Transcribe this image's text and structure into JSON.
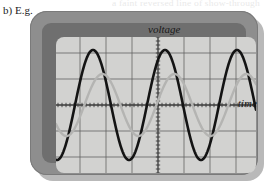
{
  "caption": {
    "text": "b) E.g."
  },
  "bleed_through": {
    "text": "a faint reversed line of show-through text"
  },
  "scope": {
    "label": "oscilloscope-display",
    "colors": {
      "bezel": "#8e8e8e",
      "inner_frame": "#6f6f6f",
      "screen": "#d2d2d0",
      "shadow": "#b9b9b9",
      "grid": "#5c5c5c",
      "axis": "#3a3a3a",
      "trace_primary": "#141414",
      "trace_secondary": "#b4b4b2"
    },
    "axes": {
      "y_label": "voltage",
      "x_label": "time"
    }
  },
  "chart_data": {
    "type": "line",
    "title": "",
    "xlabel": "time",
    "ylabel": "voltage",
    "grid": true,
    "legend": "none",
    "xlim": [
      0,
      200
    ],
    "ylim": [
      -68,
      68
    ],
    "x_axis_y": 68,
    "y_axis_x": 102,
    "grid_spacing_x": 26,
    "grid_spacing_y": 26,
    "tick_spacing": 4,
    "series": [
      {
        "name": "primary-trace",
        "color": "#141414",
        "amplitude": 55,
        "period": 72,
        "phase_deg": 55,
        "offset": 0,
        "width": 2.6
      },
      {
        "name": "secondary-trace",
        "color": "#b4b4b2",
        "amplitude": 31,
        "period": 72,
        "phase_deg": 8,
        "offset": 0,
        "width": 2.4
      }
    ]
  }
}
